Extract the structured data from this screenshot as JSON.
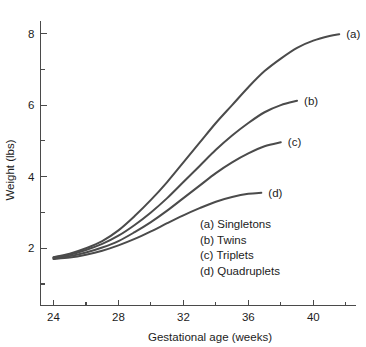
{
  "chart_data": {
    "type": "line",
    "title": "",
    "xlabel": "Gestational age (weeks)",
    "ylabel": "Weight (lbs)",
    "xlim": [
      23.2,
      42.6
    ],
    "ylim": [
      0.4,
      8.35
    ],
    "grid": false,
    "x_ticks_major": [
      24,
      28,
      32,
      36,
      40
    ],
    "x_ticks_major_labels": [
      "24",
      "28",
      "32",
      "36",
      "40"
    ],
    "x_ticks_minor": [
      26,
      30,
      34,
      38,
      42
    ],
    "y_ticks_major": [
      2,
      4,
      6,
      8
    ],
    "y_ticks_major_labels": [
      "2",
      "4",
      "6",
      "8"
    ],
    "y_ticks_minor": [
      1,
      3,
      5,
      7
    ],
    "legend_position": "inside-lower-right",
    "series": [
      {
        "key": "a",
        "name": "Singletons",
        "legend_label": "(a) Singletons",
        "end_label": "(a)",
        "color": "#4b4b4b",
        "x": [
          24,
          25,
          26,
          27,
          28,
          29,
          30,
          31,
          32,
          33,
          34,
          35,
          36,
          37,
          38,
          39,
          40,
          41,
          41.6
        ],
        "y": [
          1.75,
          1.85,
          2.0,
          2.2,
          2.5,
          2.9,
          3.35,
          3.85,
          4.4,
          4.95,
          5.5,
          6.0,
          6.5,
          6.95,
          7.3,
          7.6,
          7.8,
          7.93,
          7.98
        ]
      },
      {
        "key": "b",
        "name": "Twins",
        "legend_label": "(b) Twins",
        "end_label": "(b)",
        "color": "#4b4b4b",
        "x": [
          24,
          25,
          26,
          27,
          28,
          29,
          30,
          31,
          32,
          33,
          34,
          35,
          36,
          37,
          38,
          39
        ],
        "y": [
          1.74,
          1.82,
          1.95,
          2.12,
          2.35,
          2.65,
          3.0,
          3.4,
          3.85,
          4.3,
          4.75,
          5.15,
          5.5,
          5.8,
          6.0,
          6.12
        ]
      },
      {
        "key": "c",
        "name": "Triplets",
        "legend_label": "(c) Triplets",
        "end_label": "(c)",
        "color": "#4b4b4b",
        "x": [
          24,
          25,
          26,
          27,
          28,
          29,
          30,
          31,
          32,
          33,
          34,
          35,
          36,
          37,
          38
        ],
        "y": [
          1.72,
          1.78,
          1.88,
          2.02,
          2.2,
          2.45,
          2.73,
          3.05,
          3.4,
          3.75,
          4.1,
          4.4,
          4.65,
          4.85,
          4.96
        ]
      },
      {
        "key": "d",
        "name": "Quadruplets",
        "legend_label": "(d) Quadruplets",
        "end_label": "(d)",
        "color": "#4b4b4b",
        "x": [
          24,
          25,
          26,
          27,
          28,
          29,
          30,
          31,
          32,
          33,
          34,
          35,
          36,
          36.8
        ],
        "y": [
          1.7,
          1.74,
          1.82,
          1.93,
          2.08,
          2.26,
          2.47,
          2.7,
          2.92,
          3.12,
          3.3,
          3.43,
          3.52,
          3.55
        ]
      }
    ],
    "legend_entries": [
      "(a) Singletons",
      "(b) Twins",
      "(c) Triplets",
      "(d) Quadruplets"
    ]
  }
}
